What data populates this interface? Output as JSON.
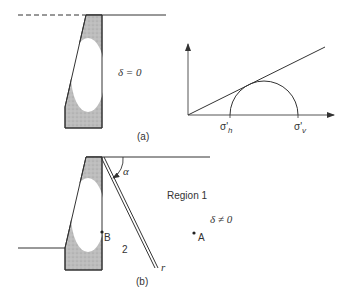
{
  "figure_a": {
    "caption": "(a)",
    "condition": "δ = 0",
    "graph": {
      "x_labels": [
        "σ'h",
        "σ'v"
      ],
      "x_label_h": "σ'",
      "x_label_h_sub": "h",
      "x_label_v": "σ'",
      "x_label_v_sub": "v"
    }
  },
  "figure_b": {
    "caption": "(b)",
    "condition": "δ ≠ 0",
    "region1_label": "Region 1",
    "region2_label": "2",
    "point_a": "A",
    "point_b": "B",
    "angle_label": "α",
    "line_end_label": "r"
  },
  "colors": {
    "line": "#333333",
    "fill": "#b8b8b8",
    "background": "#ffffff"
  }
}
